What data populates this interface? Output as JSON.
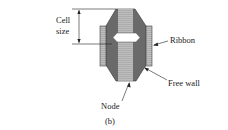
{
  "figure": {
    "labels": {
      "cell_size_line1": "Cell",
      "cell_size_line2": "size",
      "ribbon": "Ribbon",
      "free_wall": "Free wall",
      "node": "Node",
      "caption": "(b)"
    },
    "colors": {
      "light_fill": "#b8b8b8",
      "dark_fill": "#6a6a6a",
      "outline": "#333333",
      "background": "#ffffff"
    }
  }
}
